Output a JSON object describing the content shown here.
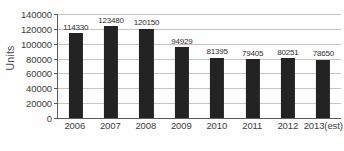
{
  "chart_data": {
    "type": "bar",
    "title": "",
    "xlabel": "",
    "ylabel": "Units",
    "categories": [
      "2006",
      "2007",
      "2008",
      "2009",
      "2010",
      "2011",
      "2012",
      "2013(est)"
    ],
    "values": [
      114330,
      123480,
      120150,
      94929,
      81395,
      79405,
      80251,
      78650
    ],
    "value_labels": [
      "114330",
      "123480",
      "120150",
      "94929",
      "81395",
      "79405",
      "80251",
      "78650"
    ],
    "ylim": [
      0,
      140000
    ],
    "ytick_values": [
      0,
      20000,
      40000,
      60000,
      80000,
      100000,
      120000,
      140000
    ],
    "ytick_labels": [
      "0",
      "20000",
      "40000",
      "60000",
      "80000",
      "100000",
      "120000",
      "140000"
    ],
    "grid": true,
    "legend": false,
    "bar_color": "#232323",
    "gridline_color": "#c6c6c6",
    "axis_color": "#5a5a5a"
  },
  "caption": {
    "remnant_text": ""
  }
}
